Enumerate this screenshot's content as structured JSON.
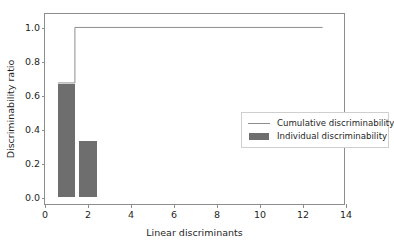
{
  "chart_data": {
    "type": "bar",
    "title": "",
    "xlabel": "Linear discriminants",
    "ylabel": "Discriminability ratio",
    "xlim": [
      0,
      14
    ],
    "ylim": [
      -0.05,
      1.08
    ],
    "grid": false,
    "legend_position": "center right",
    "xticks": [
      0,
      2,
      4,
      6,
      8,
      10,
      12,
      14
    ],
    "xticklabels": [
      "0",
      "2",
      "4",
      "6",
      "8",
      "10",
      "12",
      "14"
    ],
    "yticks": [
      0.0,
      0.2,
      0.4,
      0.6,
      0.8,
      1.0
    ],
    "yticklabels": [
      "0.0",
      "0.2",
      "0.4",
      "0.6",
      "0.8",
      "1.0"
    ],
    "categories": [
      1,
      2
    ],
    "bar_width": 0.8,
    "series": [
      {
        "name": "Individual discriminability",
        "type": "bar",
        "color": "#6e6e6e",
        "x": [
          1,
          2
        ],
        "values": [
          0.67,
          0.33
        ]
      },
      {
        "name": "Cumulative discriminability",
        "type": "step",
        "color": "#8d8d8d",
        "x": [
          0.6,
          1.4,
          13.0
        ],
        "values": [
          0.67,
          1.0,
          1.0
        ]
      }
    ]
  },
  "legend": {
    "entries": [
      {
        "label": "Cumulative discriminability",
        "key": "line",
        "color": "#8d8d8d"
      },
      {
        "label": "Individual discriminability",
        "key": "patch",
        "color": "#6e6e6e"
      }
    ]
  },
  "colors": {
    "bar": "#6e6e6e",
    "line": "#8d8d8d",
    "spine": "#8d8d8d",
    "text": "#1f1f1f",
    "background": "#ffffff",
    "legend_border": "#cfcfcf"
  }
}
